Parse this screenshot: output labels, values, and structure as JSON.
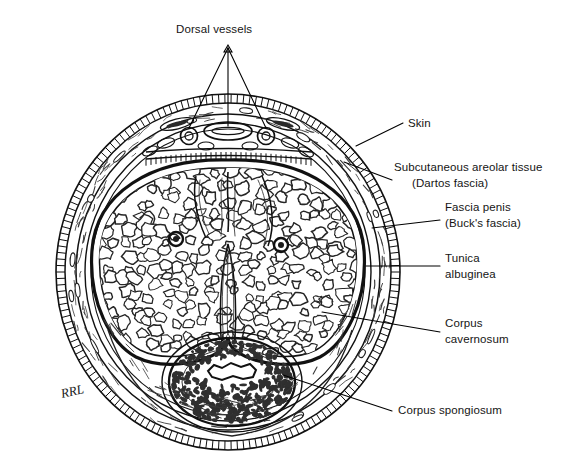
{
  "figure": {
    "style": "black-and-white line drawing",
    "background_color": "#ffffff",
    "ink_color": "#111111",
    "signature": "RRL"
  },
  "labels": [
    {
      "id": "dorsal-vessels",
      "text": "Dorsal vessels",
      "position": "top",
      "x": 176,
      "y": 33,
      "leader_kind": "three-way-fan",
      "targets": [
        "dorsal vein",
        "left dorsal artery",
        "right dorsal artery"
      ]
    },
    {
      "id": "skin",
      "text": "Skin",
      "position": "right",
      "x": 408,
      "y": 127,
      "leader_kind": "single",
      "targets": [
        "outer hatched skin ring"
      ]
    },
    {
      "id": "subcutaneous-areolar-tissue",
      "line1": "Subcutaneous areolar tissue",
      "line2": "(Dartos fascia)",
      "position": "right",
      "x": 394,
      "y": 171,
      "leader_kind": "single",
      "targets": [
        "subcutaneous areolar layer"
      ]
    },
    {
      "id": "fascia-penis",
      "line1": "Fascia penis",
      "line2": "(Buck's fascia)",
      "position": "right",
      "x": 445,
      "y": 211,
      "leader_kind": "single",
      "targets": [
        "deep fascia of penis"
      ]
    },
    {
      "id": "tunica-albuginea",
      "line1": "Tunica",
      "line2": "albuginea",
      "position": "right",
      "x": 445,
      "y": 262,
      "leader_kind": "single",
      "targets": [
        "thick tunica albuginea ring"
      ]
    },
    {
      "id": "corpus-cavernosum",
      "line1": "Corpus",
      "line2": "cavernosum",
      "position": "right",
      "x": 445,
      "y": 327,
      "leader_kind": "single",
      "targets": [
        "right corpus cavernosum erectile tissue"
      ]
    },
    {
      "id": "corpus-spongiosum",
      "text": "Corpus spongiosum",
      "position": "bottom-right",
      "x": 398,
      "y": 414,
      "leader_kind": "single",
      "targets": [
        "corpus spongiosum surrounding urethra"
      ]
    }
  ],
  "structures": {
    "outer_circle": {
      "cx": 228,
      "cy": 272,
      "rx": 172,
      "ry": 178
    },
    "skin_ring": "dense radial tick hatching around outer circumference",
    "dartos_layer": "loose areolar band with lenticular vessel profiles",
    "bucks_fascia": "thin concentric line inside the dartos layer",
    "tunica_albuginea": "heavy dark ring enclosing the paired corpora cavernosa",
    "corpora_cavernosa": {
      "count": 2,
      "description": "paired spongy erectile bodies joined at a midline septum",
      "septum": "median raphe projecting upward and downward from centre"
    },
    "cavernosal_arteries": {
      "count": 2,
      "left_xy": [
        176,
        239
      ],
      "right_xy": [
        281,
        245
      ]
    },
    "dorsal_vein": {
      "cx": 228,
      "cy": 131,
      "rx": 23,
      "ry": 8
    },
    "dorsal_arteries": [
      {
        "cx": 189,
        "cy": 136,
        "r": 8
      },
      {
        "cx": 266,
        "cy": 136,
        "r": 8
      }
    ],
    "corpus_spongiosum": {
      "cx": 232,
      "cy": 382,
      "rx": 63,
      "ry": 44
    },
    "urethra": {
      "cx": 232,
      "cy": 371,
      "rx": 24,
      "ry": 9,
      "shape": "irregular stellate lumen"
    }
  }
}
